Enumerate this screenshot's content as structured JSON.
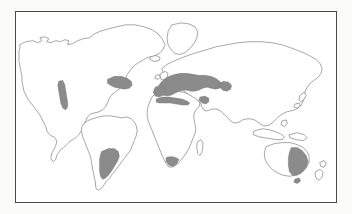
{
  "figure": {
    "type": "world-distribution-map",
    "title": "",
    "caption": "",
    "background_color": "#fbfbfa",
    "map_background_color": "#ffffff",
    "frame_color": "#4a4a4a",
    "coastline_color": "#5d5d5d",
    "range_fill_color": "#8b8b8b",
    "projection": "equirectangular"
  },
  "legend": {
    "visible": false,
    "entries": [
      {
        "label": "",
        "swatch_color": "#8b8b8b"
      }
    ]
  },
  "regions": {
    "shaded_label": "",
    "items": [
      {
        "name": "mediterranean-europe",
        "label": ""
      },
      {
        "name": "north-africa-coast",
        "label": ""
      },
      {
        "name": "western-asia-caspian",
        "label": ""
      },
      {
        "name": "eastern-north-america",
        "label": ""
      },
      {
        "name": "california-baja-coast",
        "label": ""
      },
      {
        "name": "central-chile-argentina",
        "label": ""
      },
      {
        "name": "cape-south-africa",
        "label": ""
      },
      {
        "name": "southeastern-australia",
        "label": ""
      }
    ]
  },
  "landmasses": [
    {
      "name": "north-america",
      "label": ""
    },
    {
      "name": "south-america",
      "label": ""
    },
    {
      "name": "greenland",
      "label": ""
    },
    {
      "name": "africa",
      "label": ""
    },
    {
      "name": "europe",
      "label": ""
    },
    {
      "name": "asia",
      "label": ""
    },
    {
      "name": "australia",
      "label": ""
    },
    {
      "name": "new-zealand",
      "label": ""
    },
    {
      "name": "japan",
      "label": ""
    },
    {
      "name": "indonesia",
      "label": ""
    },
    {
      "name": "madagascar",
      "label": ""
    },
    {
      "name": "british-isles",
      "label": ""
    },
    {
      "name": "iceland",
      "label": ""
    }
  ]
}
